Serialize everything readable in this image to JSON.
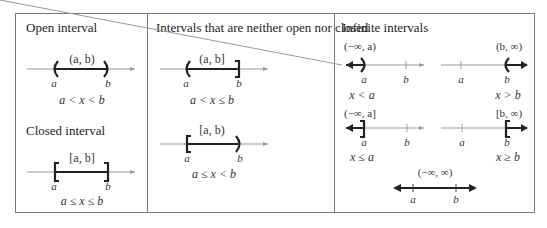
{
  "colors": {
    "border": "#777777",
    "axis": "#999999",
    "segment": "#222222",
    "text": "#333333"
  },
  "sections": {
    "open": {
      "heading": "Open interval"
    },
    "closed": {
      "heading": "Closed interval"
    },
    "half_open": {
      "heading": "Intervals that are neither open nor closed"
    },
    "infinite": {
      "heading": "Infinite intervals"
    }
  },
  "intervals": [
    {
      "id": "open",
      "notation": "(a, b)",
      "inequality": "a < x < b",
      "left_label": "a",
      "right_label": "b",
      "left_end": "open",
      "right_end": "open"
    },
    {
      "id": "closed",
      "notation": "[a, b]",
      "inequality": "a ≤ x ≤ b",
      "left_label": "a",
      "right_label": "b",
      "left_end": "closed",
      "right_end": "closed"
    },
    {
      "id": "left-open-right-closed",
      "notation": "(a, b]",
      "inequality": "a < x ≤ b",
      "left_label": "a",
      "right_label": "b",
      "left_end": "open",
      "right_end": "closed"
    },
    {
      "id": "left-closed-right-open",
      "notation": "[a, b)",
      "inequality": "a ≤ x < b",
      "left_label": "a",
      "right_label": "b",
      "left_end": "closed",
      "right_end": "open"
    },
    {
      "id": "neg-inf-to-a-open",
      "notation": "(−∞, a)",
      "inequality": "x < a",
      "left_label": "a",
      "right_label": "b"
    },
    {
      "id": "b-to-inf-open",
      "notation": "(b, ∞)",
      "inequality": "x > b",
      "left_label": "a",
      "right_label": "b"
    },
    {
      "id": "neg-inf-to-a-closed",
      "notation": "(−∞, a]",
      "inequality": "x ≤ a",
      "left_label": "a",
      "right_label": "b"
    },
    {
      "id": "b-to-inf-closed",
      "notation": "[b, ∞)",
      "inequality": "x ≥ b",
      "left_label": "a",
      "right_label": "b"
    },
    {
      "id": "all-reals",
      "notation": "(−∞, ∞)",
      "inequality": "",
      "left_label": "a",
      "right_label": "b"
    }
  ]
}
